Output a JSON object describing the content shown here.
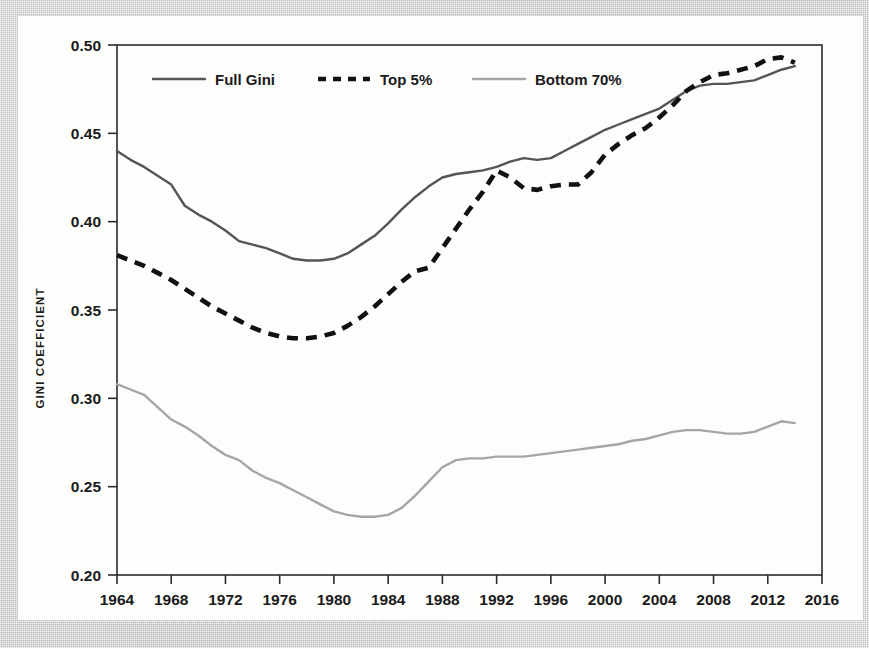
{
  "chart_data": {
    "type": "line",
    "title": "",
    "xlabel": "",
    "ylabel": "GINI COEFFICIENT",
    "xlim": [
      1964,
      2016
    ],
    "ylim": [
      0.2,
      0.5
    ],
    "grid": false,
    "legend_position": "top-left-inside",
    "xticks": [
      1964,
      1968,
      1972,
      1976,
      1980,
      1984,
      1988,
      1992,
      1996,
      2000,
      2004,
      2008,
      2012,
      2016
    ],
    "yticks": [
      "0.20",
      "0.25",
      "0.30",
      "0.35",
      "0.40",
      "0.45",
      "0.50"
    ],
    "x": [
      1964,
      1965,
      1966,
      1967,
      1968,
      1969,
      1970,
      1971,
      1972,
      1973,
      1974,
      1975,
      1976,
      1977,
      1978,
      1979,
      1980,
      1981,
      1982,
      1983,
      1984,
      1985,
      1986,
      1987,
      1988,
      1989,
      1990,
      1991,
      1992,
      1993,
      1994,
      1995,
      1996,
      1997,
      1998,
      1999,
      2000,
      2001,
      2002,
      2003,
      2004,
      2005,
      2006,
      2007,
      2008,
      2009,
      2010,
      2011,
      2012,
      2013,
      2014
    ],
    "series": [
      {
        "name": "Full Gini",
        "style": "solid",
        "color": "#555555",
        "values": [
          0.44,
          0.435,
          0.431,
          0.426,
          0.421,
          0.409,
          0.404,
          0.4,
          0.395,
          0.389,
          0.387,
          0.385,
          0.382,
          0.379,
          0.378,
          0.378,
          0.379,
          0.382,
          0.387,
          0.392,
          0.399,
          0.407,
          0.414,
          0.42,
          0.425,
          0.427,
          0.428,
          0.429,
          0.431,
          0.434,
          0.436,
          0.435,
          0.436,
          0.44,
          0.444,
          0.448,
          0.452,
          0.455,
          0.458,
          0.461,
          0.464,
          0.469,
          0.474,
          0.477,
          0.478,
          0.478,
          0.479,
          0.48,
          0.483,
          0.486,
          0.488
        ]
      },
      {
        "name": "Top 5%",
        "style": "dashed",
        "color": "#111111",
        "values": [
          0.381,
          0.378,
          0.375,
          0.371,
          0.367,
          0.362,
          0.357,
          0.352,
          0.348,
          0.344,
          0.34,
          0.337,
          0.335,
          0.334,
          0.334,
          0.335,
          0.337,
          0.341,
          0.346,
          0.352,
          0.359,
          0.366,
          0.372,
          0.374,
          0.385,
          0.396,
          0.407,
          0.417,
          0.429,
          0.425,
          0.419,
          0.418,
          0.42,
          0.421,
          0.421,
          0.428,
          0.438,
          0.444,
          0.449,
          0.453,
          0.459,
          0.466,
          0.474,
          0.479,
          0.483,
          0.484,
          0.486,
          0.488,
          0.492,
          0.493,
          0.49
        ]
      },
      {
        "name": "Bottom 70%",
        "style": "solid-light",
        "color": "#a6a6a6",
        "values": [
          0.308,
          0.305,
          0.302,
          0.295,
          0.288,
          0.284,
          0.279,
          0.273,
          0.268,
          0.265,
          0.259,
          0.255,
          0.252,
          0.248,
          0.244,
          0.24,
          0.236,
          0.234,
          0.233,
          0.233,
          0.234,
          0.238,
          0.245,
          0.253,
          0.261,
          0.265,
          0.266,
          0.266,
          0.267,
          0.267,
          0.267,
          0.268,
          0.269,
          0.27,
          0.271,
          0.272,
          0.273,
          0.274,
          0.276,
          0.277,
          0.279,
          0.281,
          0.282,
          0.282,
          0.281,
          0.28,
          0.28,
          0.281,
          0.284,
          0.287,
          0.286
        ]
      }
    ]
  },
  "legend": {
    "items": [
      {
        "label": "Full Gini"
      },
      {
        "label": "Top 5%"
      },
      {
        "label": "Bottom 70%"
      }
    ]
  }
}
